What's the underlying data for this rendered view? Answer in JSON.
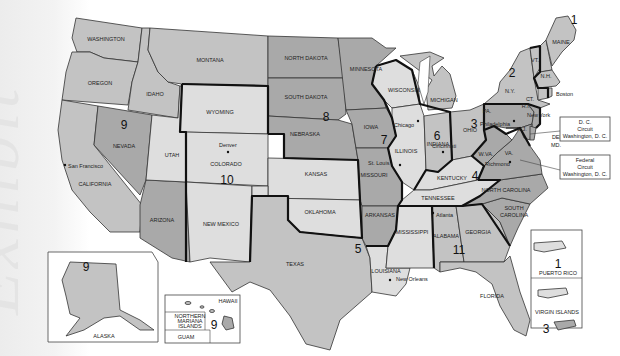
{
  "watermark": "Exhibit",
  "map": {
    "title": "Geographic Boundaries of United States Courts of Appeals and District Courts",
    "circuits": [
      {
        "number": "1",
        "states": [
          "MAINE",
          "N.H.",
          "MASS.",
          "R.I.",
          "PUERTO RICO"
        ]
      },
      {
        "number": "2",
        "states": [
          "N.Y.",
          "VT.",
          "CT."
        ]
      },
      {
        "number": "3",
        "states": [
          "PA.",
          "N.J.",
          "DEL.",
          "VIRGIN ISLANDS"
        ]
      },
      {
        "number": "4",
        "states": [
          "MD.",
          "VA.",
          "W.VA.",
          "NORTH CAROLINA",
          "SOUTH CAROLINA"
        ]
      },
      {
        "number": "5",
        "states": [
          "TEXAS",
          "LOUISIANA",
          "MISSISSIPPI"
        ]
      },
      {
        "number": "6",
        "states": [
          "MICHIGAN",
          "OHIO",
          "KENTUCKY",
          "TENNESSEE"
        ]
      },
      {
        "number": "7",
        "states": [
          "WISCONSIN",
          "ILLINOIS",
          "INDIANA"
        ]
      },
      {
        "number": "8",
        "states": [
          "NORTH DAKOTA",
          "SOUTH DAKOTA",
          "NEBRASKA",
          "MINNESOTA",
          "IOWA",
          "MISSOURI",
          "ARKANSAS"
        ]
      },
      {
        "number": "9",
        "states": [
          "WASHINGTON",
          "OREGON",
          "CALIFORNIA",
          "NEVADA",
          "IDAHO",
          "MONTANA",
          "ARIZONA",
          "ALASKA",
          "HAWAII",
          "NORTHERN MARIANA ISLANDS",
          "GUAM"
        ]
      },
      {
        "number": "10",
        "states": [
          "WYOMING",
          "UTAH",
          "COLORADO",
          "KANSAS",
          "NEW MEXICO",
          "OKLAHOMA"
        ]
      },
      {
        "number": "11",
        "states": [
          "ALABAMA",
          "GEORGIA",
          "FLORIDA"
        ]
      }
    ],
    "state_labels": {
      "washington": "WASHINGTON",
      "oregon": "OREGON",
      "idaho": "IDAHO",
      "montana": "MONTANA",
      "california": "CALIFORNIA",
      "nevada": "NEVADA",
      "arizona": "ARIZONA",
      "utah": "UTAH",
      "wyoming": "WYOMING",
      "colorado": "COLORADO",
      "new_mexico": "NEW MEXICO",
      "north_dakota": "NORTH DAKOTA",
      "south_dakota": "SOUTH DAKOTA",
      "nebraska": "NEBRASKA",
      "kansas": "KANSAS",
      "oklahoma": "OKLAHOMA",
      "texas": "TEXAS",
      "minnesota": "MINNESOTA",
      "iowa": "IOWA",
      "missouri": "MISSOURI",
      "arkansas": "ARKANSAS",
      "louisiana": "LOUISIANA",
      "wisconsin": "WISCONSIN",
      "illinois": "ILLINOIS",
      "michigan": "MICHIGAN",
      "indiana": "INDIANA",
      "ohio": "OHIO",
      "kentucky": "KENTUCKY",
      "tennessee": "TENNESSEE",
      "mississippi": "MISSISSIPPI",
      "alabama": "ALABAMA",
      "georgia": "GEORGIA",
      "florida": "FLORIDA",
      "south_carolina_1": "SOUTH",
      "south_carolina_2": "CAROLINA",
      "north_carolina": "NORTH CAROLINA",
      "virginia": "VA.",
      "west_virginia": "W.VA.",
      "pennsylvania": "PA.",
      "new_york": "N.Y.",
      "vermont": "VT.",
      "new_hampshire": "N.H.",
      "maine": "MAINE",
      "connecticut": "CT.",
      "rhode_island": "R.I.",
      "new_jersey": "N.J.",
      "delaware": "DEL.",
      "maryland": "MD."
    },
    "circuit_numbers": {
      "c1": "1",
      "c2": "2",
      "c3": "3",
      "c4": "4",
      "c5": "5",
      "c6": "6",
      "c7": "7",
      "c8": "8",
      "c9": "9",
      "c10": "10",
      "c11": "11"
    },
    "cities": {
      "san_francisco": "San Francisco",
      "denver": "Denver",
      "st_louis": "St. Louis",
      "chicago": "Chicago",
      "cincinnati": "Cincinnati",
      "philadelphia": "Philadelphia",
      "richmond": "Richmond",
      "atlanta": "Atlanta",
      "new_orleans": "New Orleans",
      "new_york": "New York",
      "boston": "Boston"
    },
    "callouts": {
      "dc": {
        "line1": "D. C.",
        "line2": "Circuit",
        "line3": "Washington, D. C."
      },
      "federal": {
        "line1": "Federal",
        "line2": "Circuit",
        "line3": "Washington, D. C."
      }
    },
    "insets": {
      "alaska": {
        "label": "ALASKA",
        "number": "9"
      },
      "hawaii": {
        "label": "HAWAII",
        "number": "9"
      },
      "nmi": {
        "line1": "NORTHERN",
        "line2": "MARIANA",
        "line3": "ISLANDS"
      },
      "guam": {
        "label": "GUAM"
      },
      "puerto_rico": {
        "label": "PUERTO RICO",
        "number": "1"
      },
      "virgin_islands": {
        "label": "VIRGIN ISLANDS",
        "number": "3"
      }
    },
    "colors": {
      "lightest": "#dedede",
      "light": "#c3c3c3",
      "medium": "#a9a9a9",
      "dark": "#8f8f8f",
      "border": "#333333",
      "circuit_border": "#111111"
    }
  }
}
